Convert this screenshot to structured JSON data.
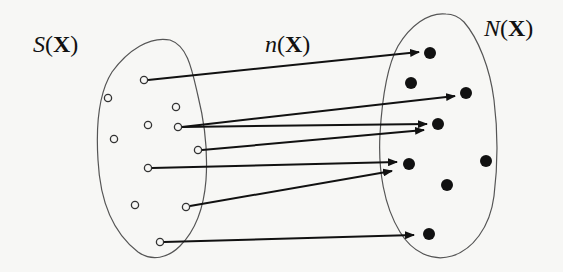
{
  "diagram": {
    "labels": {
      "domain_set": {
        "fn": "S",
        "arg": "X",
        "open": "(",
        "close": ")"
      },
      "mapping": {
        "fn": "n",
        "arg": "X",
        "open": "(",
        "close": ")"
      },
      "codomain_set": {
        "fn": "N",
        "arg": "X",
        "open": "(",
        "close": ")"
      }
    },
    "colors": {
      "ink": "#111111",
      "outline": "#555555",
      "background": "#f7f7f5"
    },
    "domain_points": [
      {
        "id": "s1",
        "x": 144,
        "y": 80,
        "mapped": true
      },
      {
        "id": "s2",
        "x": 108,
        "y": 98,
        "mapped": false
      },
      {
        "id": "s3",
        "x": 176,
        "y": 107,
        "mapped": false
      },
      {
        "id": "s4",
        "x": 148,
        "y": 125,
        "mapped": false
      },
      {
        "id": "s5",
        "x": 178,
        "y": 127,
        "mapped": true
      },
      {
        "id": "s6",
        "x": 114,
        "y": 139,
        "mapped": false
      },
      {
        "id": "s7",
        "x": 198,
        "y": 150,
        "mapped": true
      },
      {
        "id": "s8",
        "x": 148,
        "y": 168,
        "mapped": true
      },
      {
        "id": "s9",
        "x": 135,
        "y": 205,
        "mapped": false
      },
      {
        "id": "s10",
        "x": 186,
        "y": 207,
        "mapped": true
      },
      {
        "id": "s11",
        "x": 160,
        "y": 242,
        "mapped": true
      }
    ],
    "codomain_points": [
      {
        "id": "n1",
        "x": 430,
        "y": 53
      },
      {
        "id": "n2",
        "x": 411,
        "y": 83
      },
      {
        "id": "n3",
        "x": 466,
        "y": 93
      },
      {
        "id": "n4",
        "x": 438,
        "y": 124
      },
      {
        "id": "n5",
        "x": 409,
        "y": 164
      },
      {
        "id": "n6",
        "x": 486,
        "y": 161
      },
      {
        "id": "n7",
        "x": 447,
        "y": 185
      },
      {
        "id": "n8",
        "x": 429,
        "y": 234
      }
    ],
    "arrows": [
      {
        "from": "s1",
        "x1": 148,
        "y1": 80,
        "x2": 419,
        "y2": 52
      },
      {
        "from": "s5",
        "x1": 182,
        "y1": 127,
        "x2": 455,
        "y2": 96
      },
      {
        "from": "s5",
        "x1": 182,
        "y1": 127,
        "x2": 427,
        "y2": 124
      },
      {
        "from": "s7",
        "x1": 202,
        "y1": 150,
        "x2": 424,
        "y2": 130
      },
      {
        "from": "s8",
        "x1": 152,
        "y1": 168,
        "x2": 397,
        "y2": 162
      },
      {
        "from": "s10",
        "x1": 190,
        "y1": 206,
        "x2": 392,
        "y2": 171
      },
      {
        "from": "s11",
        "x1": 164,
        "y1": 242,
        "x2": 414,
        "y2": 235
      }
    ]
  }
}
